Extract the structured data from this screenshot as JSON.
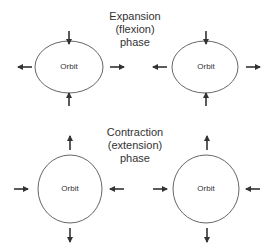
{
  "diagram": {
    "expansion": {
      "title_lines": [
        "Expansion",
        "(flexion)",
        "phase"
      ],
      "orbits": [
        {
          "label": "Orbit",
          "shape": "horizontal-ellipse",
          "arrows": "vertical-inward, horizontal-outward"
        },
        {
          "label": "Orbit",
          "shape": "horizontal-ellipse",
          "arrows": "vertical-inward, horizontal-outward"
        }
      ]
    },
    "contraction": {
      "title_lines": [
        "Contraction",
        "(extension)",
        "phase"
      ],
      "orbits": [
        {
          "label": "Orbit",
          "shape": "vertical-ellipse",
          "arrows": "vertical-outward, horizontal-inward"
        },
        {
          "label": "Orbit",
          "shape": "vertical-ellipse",
          "arrows": "vertical-outward, horizontal-inward"
        }
      ]
    },
    "colors": {
      "stroke": "#555555",
      "arrow": "#333333",
      "text": "#333333"
    }
  }
}
